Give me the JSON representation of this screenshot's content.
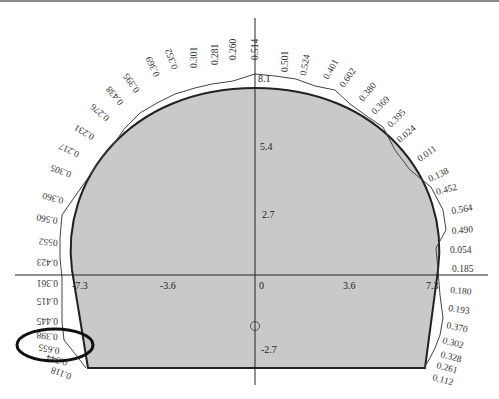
{
  "diagram": {
    "type": "tunnel-cross-section",
    "axes": {
      "x_ticks": [
        "-7.3",
        "-3.6",
        "0",
        "3.6",
        "7.3"
      ],
      "y_ticks_pos": [
        "8.1",
        "5.4",
        "2.7"
      ],
      "y_ticks_neg": [
        "-2.7"
      ]
    },
    "center_marker": "①",
    "colors": {
      "fill": "#c9c9c9",
      "outline": "#222222",
      "measure_line": "#444444",
      "annotation": "#111111"
    },
    "left_labels": [
      "0.260",
      "0.281",
      "0.301",
      "0.352",
      "0.369",
      "0.395",
      "0.438",
      "0.276",
      "0.231",
      "0.217",
      "0.305",
      "0.360",
      "0.560",
      "0552",
      "0.423",
      "0.361",
      "0.415",
      "0.445",
      "0.398",
      "0.655",
      "0.344",
      "0.118"
    ],
    "top_label": "0.514",
    "right_labels": [
      "0.501",
      "0.524",
      "0.401",
      "0.602",
      "0.380",
      "0.369",
      "0.395",
      "0.024",
      "0.011",
      "0.138",
      "0.452",
      "0.564",
      "0.490",
      "0.054",
      "0.185",
      "0.180",
      "0.193",
      "0.370",
      "0.302",
      "0.328",
      "0.261",
      "0.112"
    ],
    "annotation": "ellipse-highlight-0.655"
  }
}
